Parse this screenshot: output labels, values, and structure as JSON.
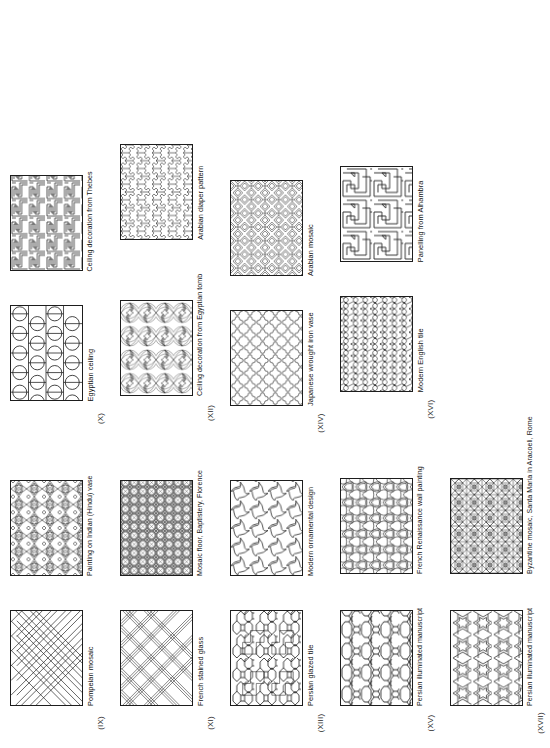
{
  "page": {
    "kind": "book-plate",
    "rotation_deg": -90,
    "background": "#ffffff",
    "ink": "#1a1a1a",
    "columns": 4,
    "rows": 5
  },
  "figures": [
    {
      "roman": "(IX)",
      "caption": "Pompeian mosaic",
      "pattern": "interlaced-diagonal-lattice"
    },
    {
      "roman": "",
      "caption": "Painting on Indian (Hindu) vase",
      "pattern": "petal-rosette-grid"
    },
    {
      "roman": "(X)",
      "caption": "Egyptian ceiling",
      "pattern": "circles-and-bars"
    },
    {
      "roman": "",
      "caption": "Ceiling decoration from Thebes",
      "pattern": "greek-key-meander"
    },
    {
      "roman": "(XI)",
      "caption": "French stained glass",
      "pattern": "triple-band-diagonal-plaid"
    },
    {
      "roman": "",
      "caption": "Mosaic floor, Baptistery, Florence",
      "pattern": "orthogonal-oval-grid"
    },
    {
      "roman": "(XII)",
      "caption": "Ceiling decoration from Egyptian tomb",
      "pattern": "radiating-fan-rosettes"
    },
    {
      "roman": "",
      "caption": "Arabian diaper pattern",
      "pattern": "stepped-cross-diaper"
    },
    {
      "roman": "(XIII)",
      "caption": "Persian glazed tile",
      "pattern": "hexagon-zigzag-tile"
    },
    {
      "roman": "",
      "caption": "Modern ornamental design",
      "pattern": "pinwheel-spiral-tiles"
    },
    {
      "roman": "(XIV)",
      "caption": "Japanese wrought iron vase",
      "pattern": "cross-lobed-puzzle-tiles"
    },
    {
      "roman": "",
      "caption": "Arabian mosaic",
      "pattern": "angular-interlace-maze"
    },
    {
      "roman": "(XV)",
      "caption": "Persian illuminated manuscript",
      "pattern": "hexagon-octagon-network"
    },
    {
      "roman": "",
      "caption": "French Renaissance wall painting",
      "pattern": "rounded-triangle-strapwork"
    },
    {
      "roman": "(XVI)",
      "caption": "Modern English tile",
      "pattern": "curved-trefoil-net"
    },
    {
      "roman": "",
      "caption": "Panelling from Alhambra",
      "pattern": "broad-ribbon-maze"
    },
    {
      "roman": "(XVII)",
      "caption": "Persian illuminated manuscript",
      "pattern": "six-point-star-tessellation"
    },
    {
      "roman": "",
      "caption": "Byzantine mosaic, Santa Maria in Aracoeli, Rome",
      "pattern": "octagon-star-mosaic"
    }
  ]
}
